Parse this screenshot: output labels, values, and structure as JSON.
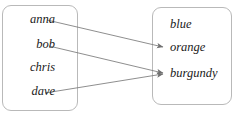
{
  "diagram": {
    "type": "mapping-diagram",
    "title": "",
    "domain_set": {
      "name": "domain",
      "elements": [
        {
          "id": "anna",
          "label": "anna",
          "x": 55,
          "y": 22
        },
        {
          "id": "bob",
          "label": "bob",
          "x": 55,
          "y": 47
        },
        {
          "id": "chris",
          "label": "chris",
          "x": 55,
          "y": 70
        },
        {
          "id": "dave",
          "label": "dave",
          "x": 55,
          "y": 94
        }
      ]
    },
    "codomain_set": {
      "name": "codomain",
      "elements": [
        {
          "id": "blue",
          "label": "blue",
          "x": 170,
          "y": 27
        },
        {
          "id": "orange",
          "label": "orange",
          "x": 170,
          "y": 50
        },
        {
          "id": "burgundy",
          "label": "burgundy",
          "x": 170,
          "y": 76
        }
      ]
    },
    "arrows": [
      {
        "from": "anna",
        "to": "orange",
        "x1": 47,
        "y1": 20,
        "x2": 163,
        "y2": 47
      },
      {
        "from": "bob",
        "to": "burgundy",
        "x1": 49,
        "y1": 46,
        "x2": 163,
        "y2": 73
      },
      {
        "from": "dave",
        "to": "burgundy",
        "x1": 45,
        "y1": 93,
        "x2": 163,
        "y2": 74
      }
    ],
    "unmapped_domain_elements": [
      "chris"
    ],
    "unreached_codomain_elements": [
      "blue"
    ],
    "colors": {
      "box_border": "#b9b9b9",
      "arrow": "#7a7a7a",
      "text": "#1a1a1a",
      "background": "#ffffff"
    }
  }
}
